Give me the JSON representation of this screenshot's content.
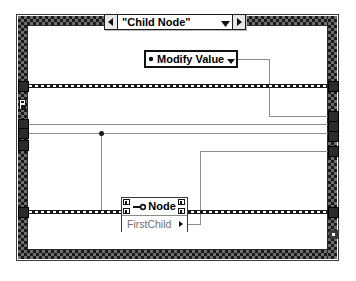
{
  "diagram": {
    "name": "labview-block-diagram",
    "structure_type": "case-structure"
  },
  "case_selector": {
    "value": "\"Child Node\"",
    "left_arrow_icon": "triangle-left-icon",
    "right_arrow_icon": "triangle-right-icon",
    "dropdown_icon": "chevron-down-icon"
  },
  "enum_constant": {
    "label": "Modify Value",
    "glyph_icon": "enum-operator-icon",
    "dropdown_icon": "chevron-down-icon"
  },
  "property_node": {
    "title": "Node",
    "reference_icon": "wire-reference-icon",
    "left_terminal_icon": "reference-terminal-icon",
    "right_terminal_icon": "reference-terminal-icon",
    "properties": [
      {
        "label": "FirstChild",
        "direction_icon": "triangle-right-icon"
      }
    ]
  },
  "tunnels": {
    "left": [
      {
        "name": "tunnel-left-error-in",
        "wire": "dashed"
      },
      {
        "name": "tunnel-left-ref-1",
        "wire": "solid"
      },
      {
        "name": "tunnel-left-ref-2",
        "wire": "solid"
      },
      {
        "name": "tunnel-left-ref-3",
        "wire": "solid"
      },
      {
        "name": "tunnel-left-error-bottom",
        "wire": "dashed"
      }
    ],
    "right": [
      {
        "name": "tunnel-right-error-out",
        "wire": "dashed"
      },
      {
        "name": "tunnel-right-out-1",
        "wire": "solid"
      },
      {
        "name": "tunnel-right-out-2",
        "wire": "solid"
      },
      {
        "name": "tunnel-right-out-3",
        "wire": "solid"
      },
      {
        "name": "tunnel-right-out-4",
        "wire": "solid"
      },
      {
        "name": "tunnel-right-error-bottom",
        "wire": "dashed"
      },
      {
        "name": "tunnel-right-unwired",
        "wire": "none"
      }
    ]
  },
  "colors": {
    "wire_solid": "#8d8d8d",
    "wire_dashed": "#1a1a1a",
    "tunnel_fill": "#2b2b2b",
    "frame_border": "#3b3b3b",
    "property_text": "#707070",
    "background": "#ffffff"
  }
}
